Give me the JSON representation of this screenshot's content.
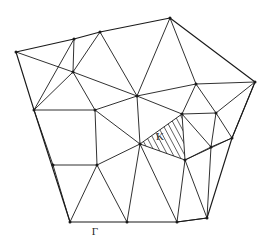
{
  "figure": {
    "name": "triangular-mesh-domain",
    "type": "diagram",
    "background_color": "#ffffff",
    "line_color": "#1a1a1a",
    "hatch_color": "#2b2b2b",
    "width": 269,
    "height": 245
  },
  "labels": {
    "element_label": "K",
    "element_label_pos": {
      "x": 160,
      "y": 140
    },
    "element_label_size": 11,
    "boundary_label": "Γ",
    "boundary_label_pos": {
      "x": 95,
      "y": 235
    },
    "boundary_label_size": 11
  },
  "mesh": {
    "boundary_vertices": [
      {
        "id": "B0",
        "x": 16,
        "y": 52
      },
      {
        "id": "B1",
        "x": 74,
        "y": 39
      },
      {
        "id": "B2",
        "x": 100,
        "y": 32
      },
      {
        "id": "B3",
        "x": 170,
        "y": 18
      },
      {
        "id": "B4",
        "x": 255,
        "y": 82
      },
      {
        "id": "B5",
        "x": 232,
        "y": 138
      },
      {
        "id": "B6",
        "x": 207,
        "y": 218
      },
      {
        "id": "B7",
        "x": 177,
        "y": 222
      },
      {
        "id": "B8",
        "x": 127,
        "y": 222
      },
      {
        "id": "B9",
        "x": 70,
        "y": 222
      },
      {
        "id": "B10",
        "x": 34,
        "y": 110
      }
    ],
    "interior_vertices": [
      {
        "id": "I0",
        "x": 73,
        "y": 72
      },
      {
        "id": "I1",
        "x": 137,
        "y": 96
      },
      {
        "id": "I2",
        "x": 95,
        "y": 110
      },
      {
        "id": "I3",
        "x": 53,
        "y": 165
      },
      {
        "id": "I4",
        "x": 97,
        "y": 165
      },
      {
        "id": "I5",
        "x": 140,
        "y": 144
      },
      {
        "id": "I6",
        "x": 185,
        "y": 160
      },
      {
        "id": "I7",
        "x": 182,
        "y": 114
      },
      {
        "id": "I8",
        "x": 216,
        "y": 113
      },
      {
        "id": "I9",
        "x": 211,
        "y": 147
      },
      {
        "id": "I10",
        "x": 196,
        "y": 84
      }
    ],
    "boundary_edges": [
      [
        "B0",
        "B1"
      ],
      [
        "B1",
        "B2"
      ],
      [
        "B2",
        "B3"
      ],
      [
        "B3",
        "B4"
      ],
      [
        "B4",
        "B5"
      ],
      [
        "B5",
        "B6"
      ],
      [
        "B6",
        "B7"
      ],
      [
        "B7",
        "B8"
      ],
      [
        "B8",
        "B9"
      ],
      [
        "B9",
        "B10"
      ],
      [
        "B10",
        "B0"
      ]
    ],
    "interior_edges": [
      [
        "B0",
        "I0"
      ],
      [
        "B1",
        "I0"
      ],
      [
        "B2",
        "I0"
      ],
      [
        "B10",
        "I0"
      ],
      [
        "B1",
        "B10"
      ],
      [
        "B2",
        "I1"
      ],
      [
        "B3",
        "I1"
      ],
      [
        "I0",
        "I1"
      ],
      [
        "I0",
        "I2"
      ],
      [
        "B10",
        "I2"
      ],
      [
        "I1",
        "I2"
      ],
      [
        "B3",
        "I10"
      ],
      [
        "B4",
        "I10"
      ],
      [
        "I1",
        "I10"
      ],
      [
        "B4",
        "I8"
      ],
      [
        "I10",
        "I8"
      ],
      [
        "I1",
        "I7"
      ],
      [
        "I10",
        "I7"
      ],
      [
        "I7",
        "I8"
      ],
      [
        "B4",
        "B5"
      ],
      [
        "I8",
        "B5"
      ],
      [
        "I8",
        "I9"
      ],
      [
        "I7",
        "I9"
      ],
      [
        "B5",
        "I9"
      ],
      [
        "I7",
        "I6"
      ],
      [
        "I9",
        "I6"
      ],
      [
        "B5",
        "I6"
      ],
      [
        "B6",
        "I6"
      ],
      [
        "B6",
        "I9"
      ],
      [
        "I1",
        "I5"
      ],
      [
        "I2",
        "I5"
      ],
      [
        "I5",
        "I6"
      ],
      [
        "I5",
        "I7"
      ],
      [
        "B10",
        "I3"
      ],
      [
        "I2",
        "I4"
      ],
      [
        "I3",
        "I4"
      ],
      [
        "I4",
        "I5"
      ],
      [
        "B9",
        "I3"
      ],
      [
        "B9",
        "I4"
      ],
      [
        "B8",
        "I4"
      ],
      [
        "B8",
        "I5"
      ],
      [
        "B7",
        "I5"
      ],
      [
        "B7",
        "I6"
      ],
      [
        "B6",
        "B7"
      ]
    ],
    "hatched_element": {
      "label": "K",
      "vertices": [
        {
          "x": 140,
          "y": 144
        },
        {
          "x": 182,
          "y": 114
        },
        {
          "x": 185,
          "y": 160
        }
      ],
      "hatch_spacing": 5,
      "hatch_angle_deg": 62
    }
  }
}
